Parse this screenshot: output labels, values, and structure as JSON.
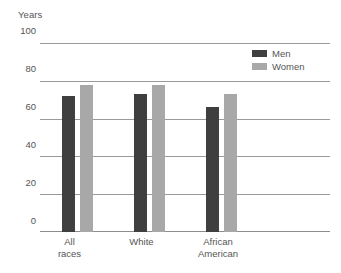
{
  "chart_data": {
    "type": "bar",
    "title": "",
    "ylabel": "Years",
    "xlabel": "",
    "ylim": [
      0,
      100
    ],
    "yticks": [
      "0",
      "20",
      "40",
      "60",
      "80",
      "100"
    ],
    "grid": true,
    "legend_position": "top-right",
    "categories": [
      "All races",
      "White",
      "African American"
    ],
    "category_lines": [
      [
        "All",
        "races"
      ],
      [
        "White"
      ],
      [
        "African",
        "American"
      ]
    ],
    "series": [
      {
        "name": "Men",
        "color": "#3f3f3f",
        "values": [
          72,
          73,
          66
        ]
      },
      {
        "name": "Women",
        "color": "#a8a8a8",
        "values": [
          78,
          78,
          73
        ]
      }
    ]
  },
  "legend": {
    "items": [
      {
        "label": "Men",
        "swatch": "men-swatch"
      },
      {
        "label": "Women",
        "swatch": "women-swatch"
      }
    ]
  },
  "colors": {
    "men": "#3f3f3f",
    "women": "#a8a8a8",
    "gridline": "#9a9a9a",
    "text": "#555555",
    "background": "#ffffff"
  }
}
